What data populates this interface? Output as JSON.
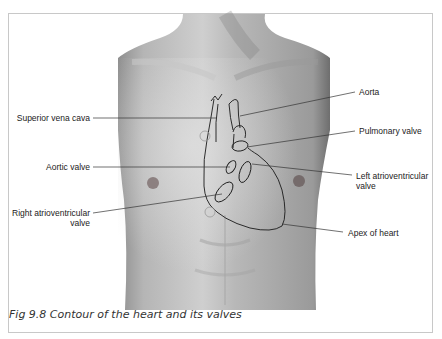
{
  "figure": {
    "caption": "Fig 9.8 Contour of the heart and its valves",
    "labels": {
      "superior_vena_cava": "Superior vena cava",
      "aorta": "Aorta",
      "pulmonary_valve": "Pulmonary valve",
      "aortic_valve": "Aortic valve",
      "left_av_line1": "Left atrioventricular",
      "left_av_line2": "valve",
      "right_av_line1": "Right atrioventricular",
      "right_av_line2": "valve",
      "apex": "Apex of heart"
    },
    "colors": {
      "skin_light": "#d6d6d6",
      "skin_dark": "#8a8a8a",
      "outline": "#1a1a1a",
      "frame": "#c8c8c8"
    }
  }
}
